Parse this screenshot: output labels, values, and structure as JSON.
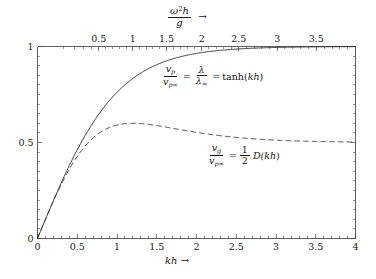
{
  "chart_data": {
    "type": "line",
    "title": "",
    "xlabel": "kh",
    "ylabel": "",
    "xlim": [
      0,
      4
    ],
    "ylim": [
      0,
      1
    ],
    "grid": false,
    "legend_position": "inline-annotation",
    "x_ticks": [
      "0",
      "0.5",
      "1",
      "1.5",
      "2",
      "2.5",
      "3",
      "3.5",
      "4"
    ],
    "x_tick_values": [
      0,
      0.5,
      1,
      1.5,
      2,
      2.5,
      3,
      3.5,
      4
    ],
    "y_ticks": [
      "0",
      "0.5",
      "1"
    ],
    "y_tick_values": [
      0,
      0.5,
      1
    ],
    "secondary_x_axis": {
      "label": "omega^2 h / g",
      "position": "top",
      "relation": "omega^2 h / g = kh tanh(kh)",
      "ticks": [
        "0.5",
        "1",
        "1.5",
        "2",
        "2.5",
        "3",
        "3.5"
      ],
      "tick_values": [
        0.5,
        1,
        1.5,
        2,
        2.5,
        3,
        3.5
      ]
    },
    "series": [
      {
        "name": "v_p / v_p_inf = lambda / lambda_inf = tanh(kh)",
        "style": "solid",
        "formula": "tanh(kh)",
        "x": [
          0,
          0.1,
          0.2,
          0.3,
          0.4,
          0.5,
          0.6,
          0.7,
          0.8,
          0.9,
          1.0,
          1.2,
          1.4,
          1.6,
          1.8,
          2.0,
          2.25,
          2.5,
          2.75,
          3.0,
          3.25,
          3.5,
          3.75,
          4.0
        ],
        "values": [
          0.0,
          0.0997,
          0.1974,
          0.2913,
          0.3799,
          0.4621,
          0.537,
          0.6044,
          0.664,
          0.7163,
          0.7616,
          0.8337,
          0.8854,
          0.9217,
          0.9468,
          0.964,
          0.978,
          0.9866,
          0.9919,
          0.9951,
          0.997,
          0.9982,
          0.9989,
          0.9993
        ]
      },
      {
        "name": "v_g / v_p_inf = (1/2) D(kh)",
        "style": "dashed",
        "formula": "0.5 * tanh(kh) * (1 + 2kh/sinh(2kh))",
        "x": [
          0,
          0.1,
          0.2,
          0.3,
          0.4,
          0.5,
          0.6,
          0.7,
          0.8,
          0.9,
          1.0,
          1.1,
          1.2,
          1.3,
          1.4,
          1.6,
          1.8,
          2.0,
          2.25,
          2.5,
          2.75,
          3.0,
          3.25,
          3.5,
          3.75,
          4.0
        ],
        "values": [
          0.0,
          0.0993,
          0.1948,
          0.2825,
          0.3599,
          0.4256,
          0.4793,
          0.5218,
          0.5543,
          0.5783,
          0.5953,
          0.6066,
          0.6133,
          0.6164,
          0.6168,
          0.6122,
          0.6021,
          0.5901,
          0.5742,
          0.5595,
          0.547,
          0.5368,
          0.5288,
          0.5226,
          0.5179,
          0.5143
        ]
      }
    ],
    "annotations": [
      {
        "id": "phase-velocity-equation",
        "text": "v_p/v_p∞ = λ/λ∞ = tanh(kh)",
        "parts": {
          "lhs_num": "v",
          "lhs_num_sub": "p",
          "lhs_den": "v",
          "lhs_den_sub": "p∞",
          "eq1": "=",
          "mid_num": "λ",
          "mid_den": "λ",
          "mid_den_sub": "∞",
          "eq2": "=",
          "rhs": "tanh(",
          "rhs_arg": "kh",
          "rhs_close": ")"
        }
      },
      {
        "id": "group-velocity-equation",
        "text": "v_g/v_p∞ = ½D(kh)",
        "parts": {
          "lhs_num": "v",
          "lhs_num_sub": "g",
          "lhs_den": "v",
          "lhs_den_sub": "p∞",
          "eq1": "=",
          "frac_num": "1",
          "frac_den": "2",
          "rhs": "D(",
          "rhs_arg": "kh",
          "rhs_close": ")"
        }
      }
    ],
    "colors": {
      "axis": "#3a3a3a",
      "solid_curve": "#222222",
      "dashed_curve": "#333333",
      "background": "#ffffff",
      "text": "#141414"
    }
  },
  "top_axis": {
    "symbol_omega": "ω",
    "exponent": "2",
    "symbol_h": "h",
    "denominator": "g",
    "arrow": "→"
  },
  "bottom_axis": {
    "symbol": "kh",
    "arrow": "→"
  }
}
